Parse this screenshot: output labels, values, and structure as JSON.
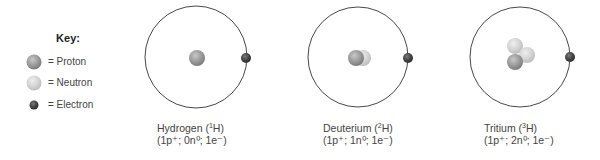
{
  "key": {
    "title": "Key:",
    "items": [
      {
        "label": "= Proton",
        "particle": "proton",
        "color": "#9a9a9a"
      },
      {
        "label": "= Neutron",
        "particle": "neutron",
        "color": "#d6d6d6"
      },
      {
        "label": "= Electron",
        "particle": "electron",
        "color": "#4a4a4a"
      }
    ]
  },
  "atoms": [
    {
      "name": "Hydrogen",
      "isotope_mass": "1",
      "symbol": "H",
      "protons": "1",
      "neutrons": "0",
      "electrons": "1",
      "line1_prefix": "Hydrogen (",
      "line1_suffix": "H)",
      "line2": "(1p⁺; 0n⁰; 1e⁻)"
    },
    {
      "name": "Deuterium",
      "isotope_mass": "2",
      "symbol": "H",
      "protons": "1",
      "neutrons": "1",
      "electrons": "1",
      "line1_prefix": "Deuterium (",
      "line1_suffix": "H)",
      "line2": "(1p⁺; 1n⁰; 1e⁻)"
    },
    {
      "name": "Tritium",
      "isotope_mass": "3",
      "symbol": "H",
      "protons": "1",
      "neutrons": "2",
      "electrons": "1",
      "line1_prefix": "Tritium (",
      "line1_suffix": "H)",
      "line2": "(1p⁺; 2n⁰; 1e⁻)"
    }
  ]
}
